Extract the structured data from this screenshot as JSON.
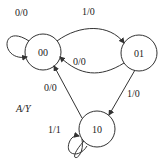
{
  "diagram": {
    "type": "state-transition",
    "legend": "A/Y",
    "states": [
      {
        "id": "00",
        "label": "00"
      },
      {
        "id": "01",
        "label": "01"
      },
      {
        "id": "10",
        "label": "10"
      }
    ],
    "transitions": [
      {
        "from": "00",
        "to": "00",
        "label": "0/0"
      },
      {
        "from": "00",
        "to": "01",
        "label": "1/0"
      },
      {
        "from": "01",
        "to": "00",
        "label": "0/0"
      },
      {
        "from": "01",
        "to": "10",
        "label": "1/0"
      },
      {
        "from": "10",
        "to": "00",
        "label": "0/0"
      },
      {
        "from": "10",
        "to": "10",
        "label": "1/1"
      }
    ]
  }
}
